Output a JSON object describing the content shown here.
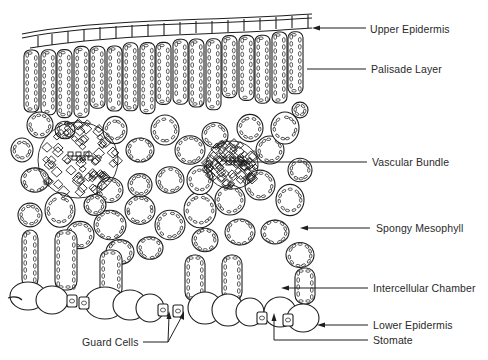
{
  "figure": {
    "labels": [
      {
        "id": "upper-epidermis",
        "text": "Upper Epidermis",
        "x": 370,
        "y": 23
      },
      {
        "id": "palisade-layer",
        "text": "Palisade Layer",
        "x": 371,
        "y": 64
      },
      {
        "id": "vascular-bundle",
        "text": "Vascular Bundle",
        "x": 372,
        "y": 157
      },
      {
        "id": "spongy-mesophyll",
        "text": "Spongy Mesophyll",
        "x": 376,
        "y": 223
      },
      {
        "id": "intercellular-chamber",
        "text": "Intercellular Chamber",
        "x": 373,
        "y": 281
      },
      {
        "id": "lower-epidermis",
        "text": "Lower Epidermis",
        "x": 373,
        "y": 318
      },
      {
        "id": "stomate",
        "text": "Stomate",
        "x": 373,
        "y": 334
      },
      {
        "id": "guard-cells",
        "text": "Guard Cells",
        "x": 82,
        "y": 337
      }
    ]
  }
}
